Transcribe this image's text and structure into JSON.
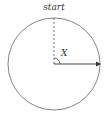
{
  "diagram": {
    "start_label": "start",
    "angle_label": "X",
    "stroke_color": "#555555",
    "circle": {
      "cx": 54,
      "cy": 64,
      "r": 46
    }
  }
}
